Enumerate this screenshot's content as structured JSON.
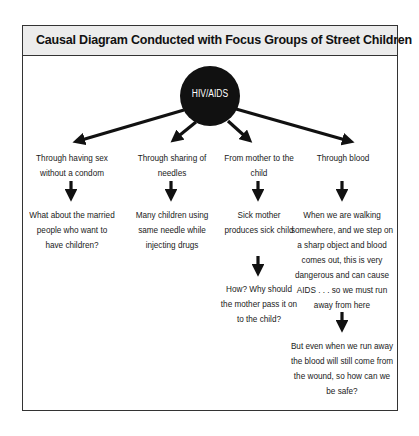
{
  "title": "Causal Diagram Conducted with Focus Groups of Street Children",
  "hub": {
    "label": "HIV/AIDS",
    "color": "#111111"
  },
  "columns": [
    {
      "cause": "Through having sex without a condom",
      "effects": [
        "What about the married people who want to have children?"
      ]
    },
    {
      "cause": "Through sharing of needles",
      "effects": [
        "Many children using same needle while injecting drugs"
      ]
    },
    {
      "cause": "From mother to the child",
      "effects": [
        "Sick mother produces sick child",
        "How? Why should the mother pass it on to the child?"
      ]
    },
    {
      "cause": "Through blood",
      "effects": [
        "When we are walking somewhere, and we step on a sharp object and blood comes out, this is very dangerous and can cause AIDS . . . so we must run away from here",
        "But even when we run away the blood will still come from the wound, so how can we be safe?"
      ]
    }
  ],
  "colors": {
    "header_bg": "#ececec",
    "border": "#333333",
    "arrow": "#111111"
  }
}
